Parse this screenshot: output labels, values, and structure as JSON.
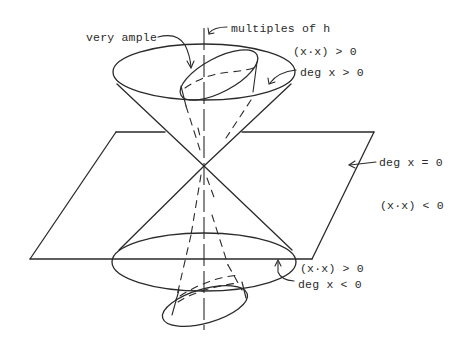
{
  "figure": {
    "colors": {
      "ink": "#2a2a2a",
      "background": "#ffffff"
    }
  },
  "labels": {
    "very_ample": "very ample",
    "multiples_of_h": "multiples of h",
    "upper_positive": "(x·x) > 0",
    "upper_degree": "deg x > 0",
    "plane_degree": "deg x = 0",
    "outside_negative": "(x·x) < 0",
    "lower_positive": "(x·x) > 0",
    "lower_degree": "deg x < 0"
  },
  "elements": {
    "axis": "vertical axis (multiples of h)",
    "upper_cone": "upper cone, deg x > 0",
    "lower_cone": "lower cone, deg x < 0",
    "plane": "plane deg x = 0",
    "upper_inner_cone": "very ample sub-cone",
    "lower_inner_cone": "negative inner sub-cone"
  }
}
